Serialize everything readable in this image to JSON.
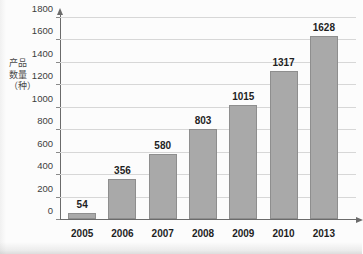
{
  "chart_data": {
    "type": "bar",
    "title": "",
    "subtitle": "",
    "xlabel": "",
    "ylabel": "产品数量（种）",
    "categories": [
      "2005",
      "2006",
      "2007",
      "2008",
      "2009",
      "2010",
      "2013"
    ],
    "values": [
      54,
      356,
      580,
      803,
      1015,
      1317,
      1628
    ],
    "value_labels": [
      "54",
      "356",
      "580",
      "803",
      "1015",
      "1317",
      "1628"
    ],
    "ylim": [
      0,
      1800
    ],
    "yticks": [
      0,
      200,
      400,
      600,
      800,
      1000,
      1200,
      1400,
      1600,
      1800
    ],
    "ytick_labels": [
      "0",
      "200",
      "400",
      "600",
      "800",
      "1000",
      "1200",
      "1400",
      "1600",
      "1800"
    ],
    "grid": true,
    "grid_axis": "y",
    "legend": false,
    "legend_position": "none",
    "series": [
      {
        "name": "产品数量（种）",
        "values": [
          54,
          356,
          580,
          803,
          1015,
          1317,
          1628
        ]
      }
    ],
    "colors": {
      "bar_fill": "#a9a9a9",
      "bar_stroke": "#8e8e8e",
      "gridline": "#d7d7d7",
      "axis": "#6b6b6b",
      "label_text": "#1f1f1f",
      "tick_text": "#3d3d3d",
      "background": "#fcfcfc"
    },
    "annotations": []
  }
}
